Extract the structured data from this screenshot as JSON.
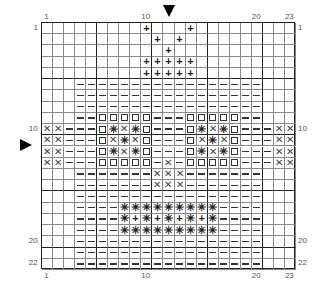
{
  "chart_data": {
    "type": "table",
    "title": "",
    "columns": 23,
    "rows": 22,
    "legend": {
      ".": "empty",
      "+": "plus",
      "-": "dash",
      "o": "square",
      "x": "cross",
      "*": "asterisk"
    },
    "grid": [
      ".........+...+.........",
      "..........+.+..........",
      "...........+...........",
      ".........+++++.........",
      ".........+++++.........",
      "...-----------------...",
      "...-----------------...",
      "...-----------------...",
      "...--ooooo---ooooo--...",
      "xx---o*x*o---o*x*o---xx",
      "xx---ox*xo---ox*xo---xx",
      "xx---o*x*o---o*x*o---xx",
      "xx---ooooo-x-ooooo---xx",
      "...-------xxx-------...",
      "...-------xxx-------...",
      "...-----------------...",
      "...----*********----...",
      "...----*+*+*+*+*----...",
      "...----*********----...",
      "...-----------------...",
      "...-----------------...",
      "...-----------------..."
    ]
  },
  "labels": {
    "top": [
      {
        "text": "1",
        "col": 1
      },
      {
        "text": "10",
        "col": 10
      },
      {
        "text": "20",
        "col": 20
      },
      {
        "text": "23",
        "col": 23
      }
    ],
    "bottom": [
      {
        "text": "1",
        "col": 1
      },
      {
        "text": "10",
        "col": 10
      },
      {
        "text": "20",
        "col": 20
      },
      {
        "text": "23",
        "col": 23
      }
    ],
    "left": [
      {
        "text": "1",
        "row": 1
      },
      {
        "text": "10",
        "row": 10
      },
      {
        "text": "20",
        "row": 20
      },
      {
        "text": "22",
        "row": 22
      }
    ],
    "right": [
      {
        "text": "1",
        "row": 1
      },
      {
        "text": "10",
        "row": 10
      },
      {
        "text": "20",
        "row": 20
      },
      {
        "text": "22",
        "row": 22
      }
    ]
  },
  "markers": {
    "top_arrow": "center-column-marker",
    "left_arrow": "center-row-marker"
  }
}
